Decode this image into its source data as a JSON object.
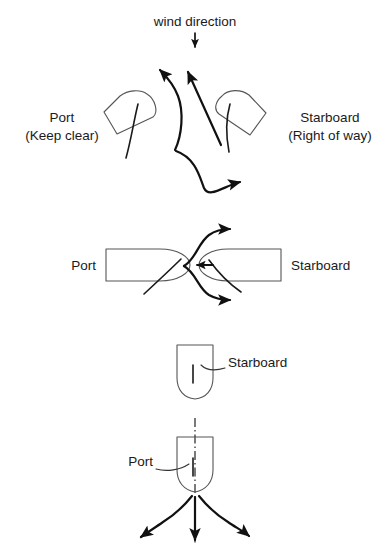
{
  "figure": {
    "background_color": "#ffffff",
    "ink_color": "#1a1a1a",
    "hull_color": "#555555"
  },
  "wind": {
    "label": "wind direction",
    "arrow_icon": "down-arrow-icon",
    "direction": "down"
  },
  "scene_top": {
    "name": "crossing-tacks",
    "port_label_line1": "Port",
    "port_label_line2": "(Keep clear)",
    "starboard_label_line1": "Starboard",
    "starboard_label_line2": "(Right of way)",
    "port_track_icon": "curved-tack-arrow-icon",
    "starboard_track_icon": "straight-arrow-icon",
    "bearaway_track_icon": "s-curve-arrow-icon"
  },
  "scene_middle": {
    "name": "head-on-meeting",
    "port_label": "Port",
    "starboard_label": "Starboard",
    "starboard_heading_icon": "left-arrow-icon",
    "port_option_up_icon": "curve-up-arrow-icon",
    "port_option_down_icon": "curve-down-arrow-icon"
  },
  "scene_bottom": {
    "name": "overtaking-astern",
    "starboard_label": "Starboard",
    "port_label": "Port",
    "centerline_icon": "dash-dot-centerline-icon",
    "arrow_left_icon": "curve-left-arrow-icon",
    "arrow_center_icon": "down-arrow-icon",
    "arrow_right_icon": "curve-right-arrow-icon"
  }
}
